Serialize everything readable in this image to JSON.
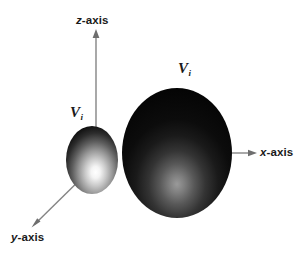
{
  "figure": {
    "background_color": "#ffffff",
    "width": 306,
    "height": 261
  },
  "axes": {
    "line_color": "#808080",
    "arrow_color": "#6e6e6e",
    "items": [
      {
        "id": "z",
        "label_prefix": "z",
        "label_suffix": "-axis",
        "direction": "up",
        "origin": [
          96,
          132
        ],
        "tip": [
          96,
          31
        ]
      },
      {
        "id": "x",
        "label_prefix": "x",
        "label_suffix": "-axis",
        "direction": "right",
        "origin": [
          225,
          153
        ],
        "tip": [
          256,
          153
        ]
      },
      {
        "id": "y",
        "label_prefix": "y",
        "label_suffix": "-axis",
        "direction": "lower-left",
        "origin": [
          92,
          168
        ],
        "tip": [
          33,
          226
        ]
      }
    ]
  },
  "lobes": [
    {
      "id": "small-lobe",
      "label_symbol": "V",
      "label_subscript": "i",
      "center": [
        92,
        160
      ],
      "radius_x": 26,
      "radius_y": 34,
      "highlight_center": [
        99,
        172
      ],
      "fill_dark": "#0b0b0b",
      "fill_mid": "#6a6a6a",
      "fill_light": "#ffffff",
      "description": "small bright-highlighted ellipsoid lobe"
    },
    {
      "id": "large-lobe",
      "label_symbol": "V",
      "label_subscript": "i",
      "center": [
        177,
        153
      ],
      "radius_x": 55,
      "radius_y": 65,
      "highlight_center": [
        176,
        190
      ],
      "fill_dark": "#050505",
      "fill_mid": "#2b2b2b",
      "fill_light": "#8e8e8e",
      "description": "large dark ellipsoid lobe with faint lower highlight"
    }
  ]
}
